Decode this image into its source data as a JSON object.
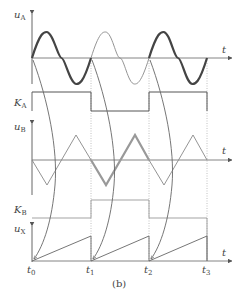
{
  "figure": {
    "caption": "(b)",
    "colors": {
      "axis": "#6a6a6a",
      "thick_signal": "#4a4a4a",
      "thin_signal": "#8a8a8a",
      "guide": "#b0b0b0"
    },
    "axes": [
      {
        "id": "uA",
        "symbol": "u",
        "subscript": "A",
        "time_label": "t"
      },
      {
        "id": "KA",
        "symbol": "K",
        "subscript": "A"
      },
      {
        "id": "uB",
        "symbol": "u",
        "subscript": "B",
        "time_label": "t"
      },
      {
        "id": "KB",
        "symbol": "K",
        "subscript": "B"
      },
      {
        "id": "uX",
        "symbol": "u",
        "subscript": "X",
        "time_label": "t"
      }
    ],
    "time_marks": [
      {
        "symbol": "t",
        "subscript": "0"
      },
      {
        "symbol": "t",
        "subscript": "1"
      },
      {
        "symbol": "t",
        "subscript": "2"
      },
      {
        "symbol": "t",
        "subscript": "3"
      }
    ],
    "signals": {
      "uA": "sine, one period per interval; intervals 1 and 3 drawn bold, interval 2 thin",
      "KA": "high in t0–t1, low in t1–t2, high in t2–t3",
      "uB": "triangle wave, starts falling from zero; interval 2 drawn bold",
      "KB": "low in t0–t1, high in t1–t2, low in t2–t3",
      "uX": "sawtooth ramp from 0 restarting at each t_i"
    }
  }
}
